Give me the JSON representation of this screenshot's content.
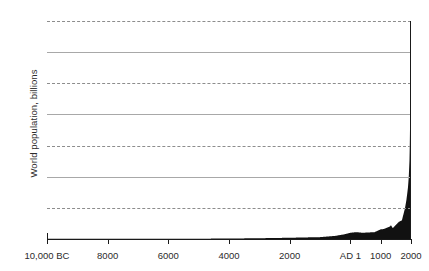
{
  "chart_data": {
    "type": "area",
    "title": "",
    "xlabel": "",
    "ylabel": "World population, billions",
    "ylim": [
      0,
      7
    ],
    "xlim": [
      -10000,
      2000
    ],
    "grid": "horizontal",
    "legend": "none",
    "series_color": "#111111",
    "y_ticks": [
      "7",
      "6",
      "5",
      "4",
      "3",
      "2",
      "1",
      "0"
    ],
    "y_tick_values": [
      7,
      6,
      5,
      4,
      3,
      2,
      1,
      0
    ],
    "x_ticks": [
      "10,000 BC",
      "8000",
      "6000",
      "4000",
      "2000",
      "AD 1",
      "1000",
      "2000"
    ],
    "x_tick_values": [
      -10000,
      -8000,
      -6000,
      -4000,
      -2000,
      1,
      1000,
      2000
    ],
    "series": [
      {
        "name": "World population",
        "x": [
          -10000,
          -9000,
          -8000,
          -7000,
          -6000,
          -5000,
          -4000,
          -3000,
          -2000,
          -1000,
          -500,
          -200,
          1,
          200,
          400,
          600,
          800,
          1000,
          1100,
          1200,
          1300,
          1340,
          1400,
          1500,
          1600,
          1700,
          1750,
          1800,
          1850,
          1900,
          1927,
          1950,
          1960,
          1974,
          1987,
          1999,
          2000,
          2010,
          2011
        ],
        "values": [
          0.004,
          0.005,
          0.006,
          0.007,
          0.008,
          0.01,
          0.015,
          0.025,
          0.04,
          0.06,
          0.1,
          0.15,
          0.2,
          0.22,
          0.2,
          0.21,
          0.22,
          0.31,
          0.32,
          0.36,
          0.4,
          0.44,
          0.35,
          0.45,
          0.55,
          0.6,
          0.79,
          0.98,
          1.26,
          1.65,
          2.0,
          2.52,
          3.02,
          4.0,
          5.0,
          6.0,
          6.07,
          6.9,
          7.0
        ]
      }
    ]
  }
}
